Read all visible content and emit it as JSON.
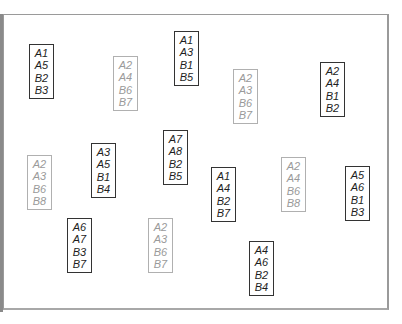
{
  "cards": [
    {
      "id": 1,
      "style": "dark",
      "x": 29,
      "y": 44,
      "labels": [
        "A1",
        "A5",
        "B2",
        "B3"
      ]
    },
    {
      "id": 2,
      "style": "light",
      "x": 113,
      "y": 56,
      "labels": [
        "A2",
        "A4",
        "B6",
        "B7"
      ]
    },
    {
      "id": 3,
      "style": "dark",
      "x": 174,
      "y": 31,
      "labels": [
        "A1",
        "A3",
        "B1",
        "B5"
      ]
    },
    {
      "id": 4,
      "style": "light",
      "x": 233,
      "y": 69,
      "labels": [
        "A2",
        "A3",
        "B6",
        "B7"
      ]
    },
    {
      "id": 5,
      "style": "dark",
      "x": 320,
      "y": 62,
      "labels": [
        "A2",
        "A4",
        "B1",
        "B2"
      ]
    },
    {
      "id": 6,
      "style": "light",
      "x": 27,
      "y": 155,
      "labels": [
        "A2",
        "A3",
        "B6",
        "B8"
      ]
    },
    {
      "id": 7,
      "style": "dark",
      "x": 91,
      "y": 143,
      "labels": [
        "A3",
        "A5",
        "B1",
        "B4"
      ]
    },
    {
      "id": 8,
      "style": "dark",
      "x": 163,
      "y": 130,
      "labels": [
        "A7",
        "A8",
        "B2",
        "B5"
      ]
    },
    {
      "id": 9,
      "style": "dark",
      "x": 211,
      "y": 167,
      "labels": [
        "A1",
        "A4",
        "B2",
        "B7"
      ]
    },
    {
      "id": 10,
      "style": "light",
      "x": 281,
      "y": 157,
      "labels": [
        "A2",
        "A4",
        "B6",
        "B8"
      ]
    },
    {
      "id": 11,
      "style": "dark",
      "x": 345,
      "y": 166,
      "labels": [
        "A5",
        "A6",
        "B1",
        "B3"
      ]
    },
    {
      "id": 12,
      "style": "dark",
      "x": 67,
      "y": 218,
      "labels": [
        "A6",
        "A7",
        "B3",
        "B7"
      ]
    },
    {
      "id": 13,
      "style": "light",
      "x": 148,
      "y": 218,
      "labels": [
        "A2",
        "A3",
        "B6",
        "B7"
      ]
    },
    {
      "id": 14,
      "style": "dark",
      "x": 249,
      "y": 241,
      "labels": [
        "A4",
        "A6",
        "B2",
        "B4"
      ]
    }
  ],
  "colors": {
    "dark_text": "#1e1e1e",
    "dark_border": "#333333",
    "light_text": "#9a9a9a",
    "light_border": "#b0b0b0"
  }
}
